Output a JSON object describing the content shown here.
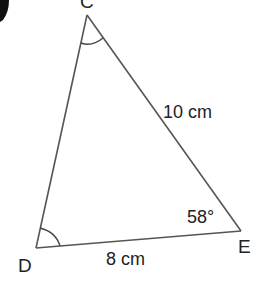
{
  "diagram": {
    "type": "triangle",
    "vertices": {
      "C": {
        "label": "C",
        "x": 87,
        "y": 15
      },
      "D": {
        "label": "D",
        "x": 36,
        "y": 248
      },
      "E": {
        "label": "E",
        "x": 241,
        "y": 231
      }
    },
    "sides": {
      "CE": {
        "label": "10 cm"
      },
      "DE": {
        "label": "8 cm"
      }
    },
    "angles": {
      "E": {
        "label": "58°"
      },
      "C": {
        "marked": true
      },
      "D": {
        "marked": true
      }
    },
    "colors": {
      "line": "#555555",
      "text": "#222222",
      "corner_mark": "#111111"
    }
  }
}
